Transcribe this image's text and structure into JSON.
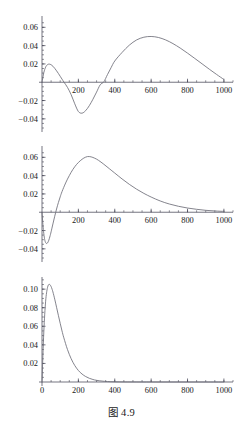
{
  "figure": {
    "caption": "图 4.9",
    "background_color": "#ffffff",
    "curve_color": "#6e6e78",
    "axis_color": "#3a3a4a"
  },
  "chart_data": [
    {
      "type": "line",
      "title": "",
      "xlabel": "",
      "ylabel": "",
      "xlim": [
        0,
        1050
      ],
      "ylim": [
        -0.05,
        0.068
      ],
      "grid": false,
      "legend": null,
      "xticks": [
        200,
        400,
        600,
        800,
        1000
      ],
      "xtick_labels": [
        "200",
        "400",
        "600",
        "800",
        "1000"
      ],
      "yticks": [
        -0.04,
        -0.02,
        0.02,
        0.04,
        0.06
      ],
      "ytick_labels": [
        "-0.04",
        "-0.02",
        "0.02",
        "0.04",
        "0.06"
      ],
      "x": [
        0,
        10,
        20,
        30,
        40,
        50,
        60,
        70,
        80,
        90,
        100,
        110,
        120,
        140,
        160,
        180,
        200,
        220,
        240,
        260,
        280,
        300,
        320,
        340,
        360,
        380,
        400,
        440,
        480,
        520,
        560,
        600,
        640,
        680,
        720,
        760,
        800,
        840,
        880,
        920,
        960,
        1000
      ],
      "y": [
        0,
        0.0105,
        0.0165,
        0.0192,
        0.0198,
        0.0191,
        0.0175,
        0.0152,
        0.0125,
        0.0096,
        0.0065,
        0.0034,
        0.0003,
        -0.0056,
        -0.0135,
        -0.0235,
        -0.032,
        -0.0338,
        -0.031,
        -0.0256,
        -0.0186,
        -0.0108,
        -0.0028,
        0.0005,
        0.0084,
        0.016,
        0.0232,
        0.0325,
        0.0405,
        0.0462,
        0.0492,
        0.05,
        0.0489,
        0.0462,
        0.0422,
        0.0373,
        0.0318,
        0.026,
        0.0201,
        0.0142,
        0.0085,
        0.003
      ]
    },
    {
      "type": "line",
      "title": "",
      "xlabel": "",
      "ylabel": "",
      "xlim": [
        0,
        1050
      ],
      "ylim": [
        -0.05,
        0.068
      ],
      "grid": false,
      "legend": null,
      "xticks": [
        200,
        400,
        600,
        800,
        1000
      ],
      "xtick_labels": [
        "200",
        "400",
        "600",
        "800",
        "1000"
      ],
      "yticks": [
        -0.04,
        -0.02,
        0.02,
        0.04,
        0.06
      ],
      "ytick_labels": [
        "-0.04",
        "-0.02",
        "0.02",
        "0.04",
        "0.06"
      ],
      "x": [
        0,
        5,
        10,
        15,
        20,
        25,
        30,
        35,
        40,
        45,
        50,
        60,
        70,
        80,
        90,
        100,
        110,
        130,
        150,
        170,
        190,
        210,
        230,
        250,
        270,
        290,
        310,
        340,
        370,
        400,
        440,
        480,
        520,
        560,
        600,
        650,
        700,
        750,
        800,
        850,
        900,
        950,
        1000
      ],
      "y": [
        0,
        -0.0135,
        -0.0235,
        -0.03,
        -0.0332,
        -0.0342,
        -0.0336,
        -0.0318,
        -0.029,
        -0.0254,
        -0.0214,
        -0.0128,
        -0.0044,
        0.0035,
        0.0105,
        0.0168,
        0.0225,
        0.032,
        0.04,
        0.0468,
        0.0522,
        0.0562,
        0.0592,
        0.0608,
        0.0605,
        0.059,
        0.0568,
        0.0524,
        0.0476,
        0.0428,
        0.0364,
        0.0305,
        0.0252,
        0.0206,
        0.0166,
        0.0123,
        0.009,
        0.0065,
        0.0046,
        0.0032,
        0.0021,
        0.0014,
        0.0009
      ]
    },
    {
      "type": "line",
      "title": "",
      "xlabel": "",
      "ylabel": "",
      "xlim": [
        0,
        1050
      ],
      "ylim": [
        0,
        0.112
      ],
      "grid": false,
      "legend": null,
      "xticks": [
        0,
        200,
        400,
        600,
        800,
        1000
      ],
      "xtick_labels": [
        "0",
        "200",
        "400",
        "600",
        "800",
        "1000"
      ],
      "yticks": [
        0.02,
        0.04,
        0.06,
        0.08,
        0.1
      ],
      "ytick_labels": [
        "0.02",
        "0.04",
        "0.06",
        "0.08",
        "0.10"
      ],
      "x": [
        0,
        5,
        10,
        15,
        20,
        25,
        30,
        35,
        40,
        45,
        50,
        55,
        60,
        70,
        80,
        90,
        100,
        110,
        120,
        140,
        160,
        180,
        200,
        220,
        240,
        260,
        280,
        300,
        330,
        360,
        400,
        450,
        500,
        600,
        700,
        800,
        900,
        1000
      ],
      "y": [
        0,
        0.029,
        0.054,
        0.073,
        0.087,
        0.096,
        0.1015,
        0.1045,
        0.1052,
        0.1045,
        0.1028,
        0.1002,
        0.097,
        0.0892,
        0.0805,
        0.0718,
        0.0632,
        0.055,
        0.0476,
        0.035,
        0.0252,
        0.0178,
        0.0124,
        0.0086,
        0.0059,
        0.004,
        0.0027,
        0.0018,
        0.001,
        0.0005,
        0.0002,
        0.0001,
        5e-05,
        1e-05,
        5e-06,
        2e-06,
        1e-06,
        5e-07
      ]
    }
  ]
}
